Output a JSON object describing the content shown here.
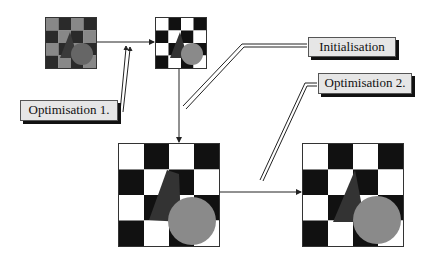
{
  "diagram": {
    "labels": {
      "opt1": "Optimisation 1.",
      "init": "Initialisation",
      "opt2": "Optimisation 2."
    },
    "images": [
      {
        "id": "input-noisy",
        "description": "noisy gray checkerboard with triangle and circle"
      },
      {
        "id": "initialised",
        "description": "binary checkerboard with gray triangle and circle"
      },
      {
        "id": "optimised-1",
        "description": "segmented checkerboard, enlarged"
      },
      {
        "id": "optimised-2",
        "description": "refined segmentation, enlarged"
      }
    ],
    "colors": {
      "dark": "#111111",
      "light": "#ffffff",
      "triangle": "#333333",
      "circle": "#8a8a8a",
      "label_bg": "#e6e6e6"
    }
  }
}
